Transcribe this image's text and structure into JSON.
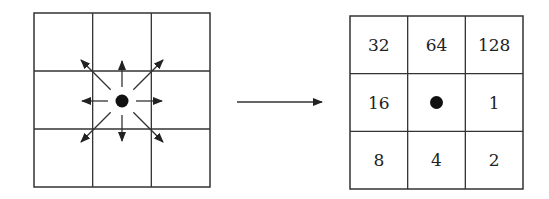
{
  "diagram": {
    "left_grid": {
      "description": "3x3 neighborhood with center pixel and arrows to 8 neighbors",
      "directions": [
        "E",
        "SE",
        "S",
        "SW",
        "W",
        "NW",
        "N",
        "NE"
      ]
    },
    "transform_arrow": "right",
    "right_grid": {
      "cells": [
        [
          "32",
          "64",
          "128"
        ],
        [
          "16",
          "",
          "1"
        ],
        [
          "8",
          "4",
          "2"
        ]
      ],
      "center": "dot"
    },
    "colors": {
      "line": "#333333",
      "dot": "#111111",
      "background": "#ffffff"
    }
  }
}
